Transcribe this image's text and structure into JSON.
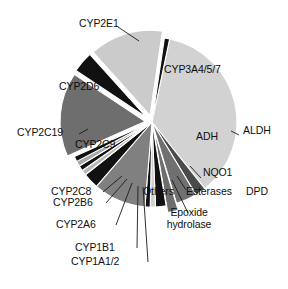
{
  "figure": {
    "background_color": "#ffffff",
    "width": 288,
    "height": 289
  },
  "chart_data": {
    "type": "pie",
    "title": "",
    "subtitle": "",
    "xlabel": "",
    "ylabel": "",
    "legend_position": "none",
    "grid": false,
    "value_unit": "percent of drugs metabolized",
    "categories": [
      "CYP3A4/5/7",
      "ALDH",
      "ADH",
      "DPD",
      "Esterases",
      "Epoxide hydrolase",
      "NQO1",
      "Others",
      "CYP1A1/2",
      "CYP1B1",
      "CYP2A6",
      "CYP2B6",
      "CYP2C8",
      "CYP2C9",
      "CYP2C19",
      "CYP2D6",
      "CYP2E1"
    ],
    "values": [
      36,
      2,
      4,
      2,
      2,
      1,
      1,
      10,
      3,
      1,
      1,
      1,
      1,
      16,
      4,
      14,
      1
    ],
    "series": [
      {
        "name": "Fraction of drug metabolism",
        "values": [
          36,
          2,
          4,
          2,
          2,
          1,
          1,
          10,
          3,
          1,
          1,
          1,
          1,
          16,
          4,
          14,
          1
        ]
      }
    ],
    "slices": [
      {
        "label": "CYP3A4/5/7",
        "value": 36,
        "color": "#d2d2d2",
        "exploded": false,
        "label_position": "inside"
      },
      {
        "label": "ALDH",
        "value": 2,
        "color": "#4a4a4a",
        "exploded": false,
        "label_position": "outside"
      },
      {
        "label": "ADH",
        "value": 4,
        "color": "#707070",
        "exploded": false,
        "label_position": "inside"
      },
      {
        "label": "DPD",
        "value": 2,
        "color": "#6e6e6e",
        "exploded": true,
        "label_position": "outside"
      },
      {
        "label": "Esterases",
        "value": 2,
        "color": "#111111",
        "exploded": false,
        "label_position": "outside"
      },
      {
        "label": "Epoxide hydrolase",
        "value": 1,
        "color": "#cfcfcf",
        "exploded": false,
        "label_position": "outside"
      },
      {
        "label": "NQO1",
        "value": 1,
        "color": "#111111",
        "exploded": false,
        "label_position": "outside"
      },
      {
        "label": "Others",
        "value": 10,
        "color": "#808080",
        "exploded": false,
        "label_position": "outside"
      },
      {
        "label": "CYP1A1/2",
        "value": 3,
        "color": "#111111",
        "exploded": false,
        "label_position": "outside"
      },
      {
        "label": "CYP1B1",
        "value": 1,
        "color": "#b8b8b8",
        "exploded": false,
        "label_position": "outside"
      },
      {
        "label": "CYP2A6",
        "value": 1,
        "color": "#111111",
        "exploded": false,
        "label_position": "outside"
      },
      {
        "label": "CYP2B6",
        "value": 1,
        "color": "#a8a8a8",
        "exploded": false,
        "label_position": "outside"
      },
      {
        "label": "CYP2C8",
        "value": 1,
        "color": "#111111",
        "exploded": false,
        "label_position": "outside"
      },
      {
        "label": "CYP2C9",
        "value": 16,
        "color": "#6e6e6e",
        "exploded": true,
        "label_position": "inside"
      },
      {
        "label": "CYP2C19",
        "value": 4,
        "color": "#111111",
        "exploded": true,
        "label_position": "outside"
      },
      {
        "label": "CYP2D6",
        "value": 14,
        "color": "#cbcbcb",
        "exploded": true,
        "label_position": "inside"
      },
      {
        "label": "CYP2E1",
        "value": 1,
        "color": "#111111",
        "exploded": false,
        "label_position": "outside"
      }
    ],
    "colors": {
      "black": "#111111",
      "dark_gray": "#4a4a4a",
      "medium_gray": "#707070",
      "mid_gray": "#808080",
      "light_gray": "#cbcbcb",
      "pale_gray": "#d2d2d2",
      "background": "#ffffff",
      "text": "#101010"
    }
  },
  "labels": {
    "cyp3a4": "CYP3A4/5/7",
    "cyp2d6": "CYP2D6",
    "cyp2e1": "CYP2E1",
    "cyp2c19": "CYP2C19",
    "cyp2c9": "CYP2C9",
    "cyp2c8": "CYP2C8",
    "cyp2b6": "CYP2B6",
    "cyp2a6": "CYP2A6",
    "cyp1b1": "CYP1B1",
    "cyp1a12": "CYP1A1/2",
    "others": "Others",
    "epoxide_hydrolase": "Epoxide\nhydrolase",
    "esterases": "Esterases",
    "nqo1": "NQO1",
    "dpd": "DPD",
    "adh": "ADH",
    "aldh": "ALDH"
  }
}
